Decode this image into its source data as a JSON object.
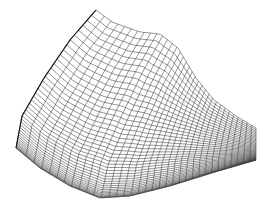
{
  "figure": {
    "type": "wireframe-surface",
    "background": "#ffffff",
    "line_color": "#3a3a3a",
    "line_width": 0.55,
    "grid_u": 34,
    "grid_v": 44,
    "corners": {
      "peak": [
        96,
        10
      ],
      "left_bottom": [
        16,
        148
      ],
      "front_bottom": [
        112,
        200
      ],
      "right_bottom": [
        256,
        160
      ],
      "right_top": [
        256,
        128
      ]
    },
    "top_edge": [
      [
        96,
        10
      ],
      [
        112,
        22
      ],
      [
        140,
        32
      ],
      [
        160,
        34
      ],
      [
        178,
        48
      ],
      [
        196,
        78
      ],
      [
        214,
        100
      ],
      [
        236,
        116
      ],
      [
        256,
        128
      ]
    ],
    "left_edge": [
      [
        96,
        10
      ],
      [
        70,
        40
      ],
      [
        44,
        78
      ],
      [
        22,
        116
      ],
      [
        16,
        148
      ]
    ],
    "bottom_edge": [
      [
        16,
        148
      ],
      [
        40,
        168
      ],
      [
        70,
        186
      ],
      [
        100,
        198
      ],
      [
        130,
        196
      ],
      [
        170,
        186
      ],
      [
        215,
        172
      ],
      [
        256,
        160
      ]
    ]
  }
}
